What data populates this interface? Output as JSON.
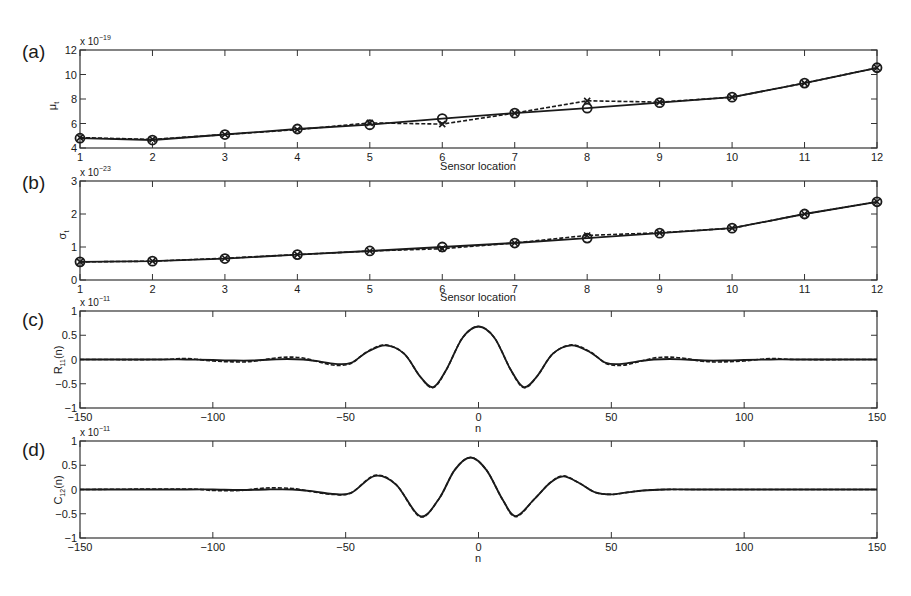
{
  "chart_data": [
    {
      "panel": "(a)",
      "type": "line",
      "title": "",
      "xlabel": "Sensor location",
      "ylabel": "μ_t",
      "y_multiplier": "x 10^-19",
      "xlim": [
        1,
        12
      ],
      "ylim": [
        4,
        12
      ],
      "x_ticks": [
        1,
        2,
        3,
        4,
        5,
        6,
        7,
        8,
        9,
        10,
        11,
        12
      ],
      "y_ticks": [
        4,
        6,
        8,
        10,
        12
      ],
      "grid": false,
      "categories": [
        1,
        2,
        3,
        4,
        5,
        6,
        7,
        8,
        9,
        10,
        11,
        12
      ],
      "series": [
        {
          "name": "solid-circle",
          "style": "solid",
          "marker": "o",
          "values": [
            4.8,
            4.65,
            5.1,
            5.55,
            5.9,
            6.4,
            6.85,
            7.25,
            7.7,
            8.15,
            9.3,
            10.55
          ]
        },
        {
          "name": "dashed-cross",
          "style": "dashed",
          "marker": "x",
          "values": [
            4.85,
            4.7,
            5.1,
            5.5,
            6.05,
            5.95,
            6.85,
            7.85,
            7.75,
            8.15,
            9.3,
            10.55
          ]
        }
      ]
    },
    {
      "panel": "(b)",
      "type": "line",
      "title": "",
      "xlabel": "Sensor location",
      "ylabel": "σ_t",
      "y_multiplier": "x 10^-23",
      "xlim": [
        1,
        12
      ],
      "ylim": [
        0,
        3
      ],
      "x_ticks": [
        1,
        2,
        3,
        4,
        5,
        6,
        7,
        8,
        9,
        10,
        11,
        12
      ],
      "y_ticks": [
        0,
        1,
        2,
        3
      ],
      "grid": false,
      "categories": [
        1,
        2,
        3,
        4,
        5,
        6,
        7,
        8,
        9,
        10,
        11,
        12
      ],
      "series": [
        {
          "name": "solid-circle",
          "style": "solid",
          "marker": "o",
          "values": [
            0.55,
            0.57,
            0.65,
            0.77,
            0.88,
            1.0,
            1.12,
            1.27,
            1.42,
            1.57,
            2.0,
            2.37
          ]
        },
        {
          "name": "dashed-cross",
          "style": "dashed",
          "marker": "x",
          "values": [
            0.55,
            0.57,
            0.66,
            0.77,
            0.88,
            0.95,
            1.12,
            1.35,
            1.43,
            1.57,
            2.0,
            2.37
          ]
        }
      ]
    },
    {
      "panel": "(c)",
      "type": "line",
      "title": "",
      "xlabel": "n",
      "ylabel": "R_11(n)",
      "y_multiplier": "x 10^-11",
      "xlim": [
        -150,
        150
      ],
      "ylim": [
        -1,
        1
      ],
      "x_ticks": [
        -150,
        -100,
        -50,
        0,
        50,
        100,
        150
      ],
      "y_ticks": [
        -1,
        -0.5,
        0,
        0.5,
        1
      ],
      "grid": false,
      "x": [
        -150,
        -120,
        -110,
        -100,
        -92,
        -85,
        -78,
        -72,
        -66,
        -60,
        -54,
        -48,
        -42,
        -35,
        -28,
        -22,
        -17,
        -12,
        -6,
        0,
        6,
        12,
        17,
        22,
        28,
        35,
        42,
        48,
        54,
        60,
        66,
        72,
        78,
        85,
        92,
        100,
        110,
        120,
        150
      ],
      "series": [
        {
          "name": "solid",
          "style": "solid",
          "values": [
            0,
            0,
            0,
            -0.01,
            -0.02,
            -0.02,
            0,
            0.01,
            0.0,
            -0.04,
            -0.09,
            -0.07,
            0.15,
            0.29,
            0.12,
            -0.35,
            -0.57,
            -0.2,
            0.45,
            0.68,
            0.45,
            -0.2,
            -0.57,
            -0.35,
            0.12,
            0.29,
            0.15,
            -0.07,
            -0.09,
            -0.04,
            0.0,
            0.01,
            0,
            -0.02,
            -0.02,
            -0.01,
            0,
            0,
            0
          ]
        },
        {
          "name": "dashed",
          "style": "dashed",
          "values": [
            0,
            0,
            0.02,
            -0.03,
            -0.05,
            -0.04,
            0.02,
            0.05,
            0.03,
            -0.05,
            -0.12,
            -0.08,
            0.16,
            0.3,
            0.12,
            -0.35,
            -0.58,
            -0.2,
            0.45,
            0.68,
            0.45,
            -0.2,
            -0.58,
            -0.35,
            0.12,
            0.3,
            0.16,
            -0.08,
            -0.12,
            -0.05,
            0.03,
            0.05,
            0.02,
            -0.04,
            -0.05,
            -0.03,
            0.02,
            0,
            0
          ]
        }
      ]
    },
    {
      "panel": "(d)",
      "type": "line",
      "title": "",
      "xlabel": "n",
      "ylabel": "C_12(n)",
      "y_multiplier": "x 10^-11",
      "xlim": [
        -150,
        150
      ],
      "ylim": [
        -1,
        1
      ],
      "x_ticks": [
        -150,
        -100,
        -50,
        0,
        50,
        100,
        150
      ],
      "y_ticks": [
        -1,
        -0.5,
        0,
        0.5,
        1
      ],
      "grid": false,
      "x": [
        -150,
        -110,
        -100,
        -90,
        -80,
        -70,
        -62,
        -55,
        -48,
        -39,
        -31,
        -22,
        -15,
        -9,
        -3,
        3,
        9,
        14,
        21,
        27,
        32,
        38,
        44,
        50,
        56,
        62,
        70,
        80,
        100,
        150
      ],
      "series": [
        {
          "name": "solid",
          "style": "solid",
          "values": [
            0,
            0,
            0,
            -0.01,
            0.0,
            0.0,
            -0.04,
            -0.09,
            -0.07,
            0.28,
            0.1,
            -0.55,
            -0.2,
            0.4,
            0.66,
            0.4,
            -0.2,
            -0.55,
            -0.2,
            0.14,
            0.27,
            0.13,
            -0.06,
            -0.1,
            -0.06,
            -0.02,
            0,
            0,
            0,
            0
          ]
        },
        {
          "name": "dashed",
          "style": "dashed",
          "values": [
            0,
            0.01,
            -0.02,
            -0.02,
            0.03,
            0.02,
            -0.05,
            -0.1,
            -0.07,
            0.29,
            0.1,
            -0.56,
            -0.2,
            0.4,
            0.66,
            0.4,
            -0.2,
            -0.56,
            -0.2,
            0.14,
            0.28,
            0.13,
            -0.06,
            -0.1,
            -0.06,
            -0.02,
            0,
            0,
            0,
            0
          ]
        }
      ]
    }
  ],
  "panels": [
    {
      "label": "(a)",
      "exponent_base": "x 10",
      "exponent": "−19",
      "ylabel_main": "μ",
      "ylabel_sub": "t",
      "ylabel_tail": "",
      "xlabel": "Sensor location"
    },
    {
      "label": "(b)",
      "exponent_base": "x 10",
      "exponent": "−23",
      "ylabel_main": "σ",
      "ylabel_sub": "t",
      "ylabel_tail": "",
      "xlabel": "Sensor location"
    },
    {
      "label": "(c)",
      "exponent_base": "x 10",
      "exponent": "−11",
      "ylabel_main": "R",
      "ylabel_sub": "11",
      "ylabel_tail": "(n)",
      "xlabel": "n"
    },
    {
      "label": "(d)",
      "exponent_base": "x 10",
      "exponent": "−11",
      "ylabel_main": "C",
      "ylabel_sub": "12",
      "ylabel_tail": "(n)",
      "xlabel": "n"
    }
  ],
  "colors": {
    "line": "#1a1a1a",
    "axis": "#333333",
    "background": "#ffffff"
  }
}
